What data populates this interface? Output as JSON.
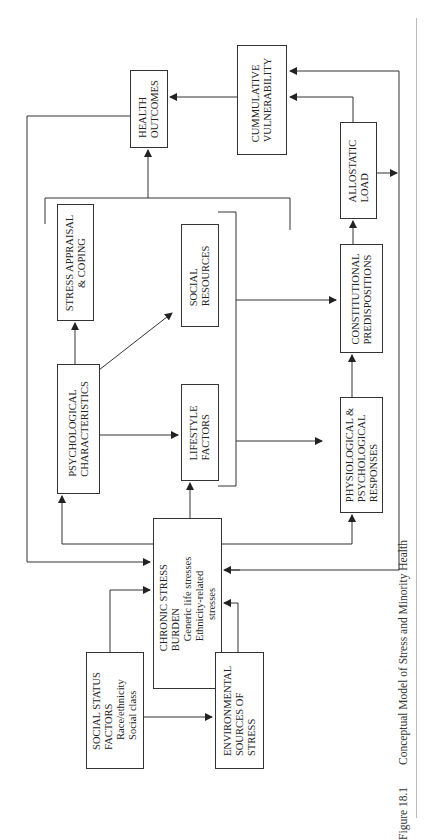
{
  "figure": {
    "number": "Figure 18.1",
    "title": "Conceptual Model of Stress and Minority Health"
  },
  "boxes": {
    "health_outcomes": {
      "line1": "HEALTH",
      "line2": "OUTCOMES"
    },
    "cumulative_vulnerability": {
      "line1": "CUMMULATIVE",
      "line2": "VULNERABILITY"
    },
    "allostatic_load": {
      "line1": "ALLOSTATIC",
      "line2": "LOAD"
    },
    "stress_appraisal": {
      "line1": "STRESS APPRAISAL",
      "line2": "& COPING"
    },
    "social_resources": {
      "line1": "SOCIAL",
      "line2": "RESOURCES"
    },
    "psychological_characteristics": {
      "line1": "PSYCHOLOGICAL",
      "line2": "CHARACTERISTICS"
    },
    "lifestyle_factors": {
      "line1": "LIFESTYLE",
      "line2": "FACTORS"
    },
    "constitutional_predispositions": {
      "line1": "CONSTITUTIONAL",
      "line2": "PREDISPOSITIONS"
    },
    "physiological_responses": {
      "line1": "PHYSIOLOGICAL &",
      "line2": "PSYCHOLOGICAL",
      "line3": "RESPONSES"
    },
    "chronic_stress_burden": {
      "line1": "CHRONIC STRESS",
      "line2": "BURDEN",
      "item1": "Generic life stresses",
      "item2": "Ethnicity-related",
      "item3": "stresses"
    },
    "social_status_factors": {
      "line1": "SOCIAL STATUS",
      "line2": "FACTORS",
      "item1": "Race/ethnicity",
      "item2": "Social class"
    },
    "environmental_sources": {
      "line1": "ENVIRONMENTAL",
      "line2": "SOURCES OF",
      "line3": "STRESS"
    }
  },
  "colors": {
    "line": "#333333",
    "background": "#ffffff",
    "divider": "#bbbbbb"
  }
}
